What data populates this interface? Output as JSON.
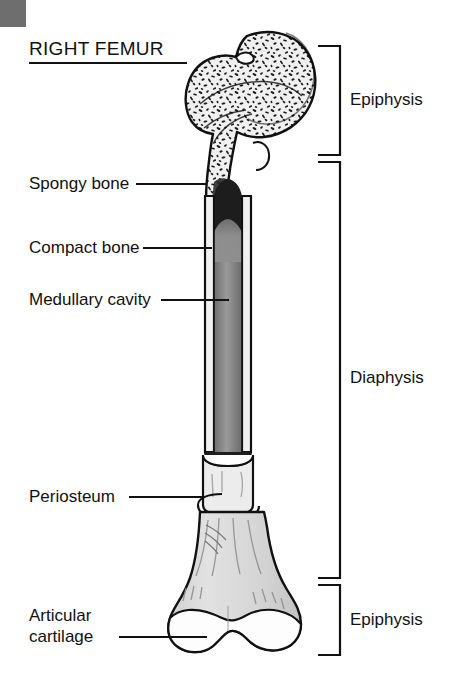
{
  "page": {
    "title": "RIGHT FEMUR",
    "corner_mark": "gray-corner-square",
    "background_color": "#ffffff",
    "ink_color": "#111111"
  },
  "labels_left": [
    {
      "id": "spongy-bone",
      "text": "Spongy bone",
      "leader": true
    },
    {
      "id": "compact-bone",
      "text": "Compact bone",
      "leader": true
    },
    {
      "id": "medullary-cavity",
      "text": "Medullary cavity",
      "leader": true
    },
    {
      "id": "periosteum",
      "text": "Periosteum",
      "leader": true
    },
    {
      "id": "articular-cartilage-l1",
      "text": "Articular",
      "leader": false
    },
    {
      "id": "articular-cartilage-l2",
      "text": "cartilage",
      "leader": true
    }
  ],
  "labels_right": [
    {
      "id": "epiphysis-proximal",
      "text": "Epiphysis"
    },
    {
      "id": "diaphysis",
      "text": "Diaphysis"
    },
    {
      "id": "epiphysis-distal",
      "text": "Epiphysis"
    }
  ],
  "brackets": [
    {
      "id": "bracket-epiphysis-proximal",
      "region": "proximal epiphysis"
    },
    {
      "id": "bracket-diaphysis",
      "region": "diaphysis"
    },
    {
      "id": "bracket-epiphysis-distal",
      "region": "distal epiphysis"
    }
  ],
  "colors": {
    "outline": "#111111",
    "bone_fill": "#d8d8d8",
    "compact_bone": "#f2f2f2",
    "spongy_fill": "#efefef",
    "marrow_dark": "#2a2a2a",
    "marrow_gray": "#8a8a8a",
    "cartilage": "#fdfdfd",
    "corner_gray": "#6e6e6e"
  }
}
